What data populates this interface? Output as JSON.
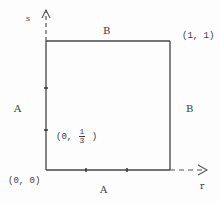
{
  "diagram": {
    "axes": {
      "vertical_label": "s",
      "horizontal_label": "r"
    },
    "edge_labels": {
      "top": "B",
      "right": "B",
      "left": "A",
      "bottom": "A"
    },
    "points": {
      "origin": "(0, 0)",
      "corner": "(1, 1)",
      "third_prefix": "(0,",
      "third_num": "1",
      "third_den": "3",
      "third_suffix": ")"
    },
    "colors": {
      "line": "#444444",
      "background": "#fdfdfd"
    }
  }
}
